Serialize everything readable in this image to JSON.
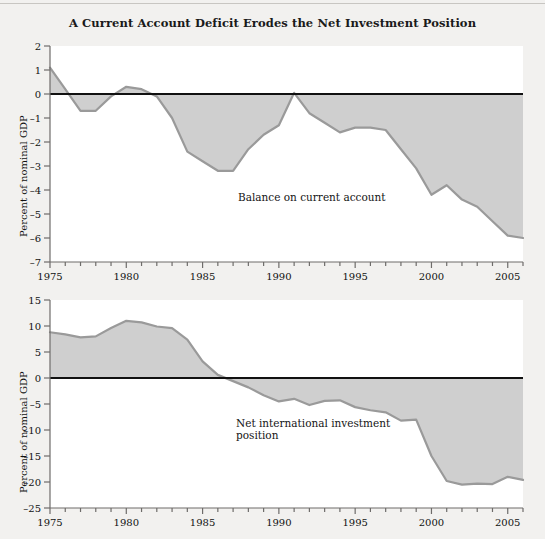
{
  "title": "A Current Account Deficit Erodes the Net Investment Position",
  "colors": {
    "page_background": "#f2f1ef",
    "plot_background": "#ffffff",
    "area_fill": "#cfcfcf",
    "series_line": "#9a9a9a",
    "zero_line": "#111111",
    "axis_line": "#6e6c6a",
    "text": "#111111"
  },
  "panels": [
    {
      "id": "current-account",
      "ylabel": "Percent of nominal GDP",
      "series_label": "Balance on current account",
      "yticks": [
        2,
        1,
        0,
        -1,
        -2,
        -3,
        -4,
        -5,
        -6,
        -7
      ],
      "ytick_labels": [
        "2",
        "1",
        "0",
        "–1",
        "–2",
        "–3",
        "–4",
        "–5",
        "–6",
        "–7"
      ],
      "xticks_major": [
        1975,
        1980,
        1985,
        1990,
        1995,
        2000,
        2005
      ],
      "xtick_labels": [
        "1975",
        "1980",
        "1985",
        "1990",
        "1995",
        "2000",
        "2005"
      ],
      "chart_data": {
        "type": "area",
        "title": "A Current Account Deficit Erodes the Net Investment Position",
        "xlabel": "",
        "ylabel": "Percent of nominal GDP",
        "xlim": [
          1975,
          2006
        ],
        "ylim": [
          -7,
          2
        ],
        "grid": false,
        "legend": "inline-annotation",
        "annotation": "Balance on current account",
        "x": [
          1975,
          1976,
          1977,
          1978,
          1979,
          1980,
          1981,
          1982,
          1983,
          1984,
          1985,
          1986,
          1987,
          1988,
          1989,
          1990,
          1991,
          1992,
          1993,
          1994,
          1995,
          1996,
          1997,
          1998,
          1999,
          2000,
          2001,
          2002,
          2003,
          2004,
          2005,
          2006
        ],
        "values": [
          1.1,
          0.2,
          -0.7,
          -0.7,
          -0.1,
          0.3,
          0.2,
          -0.1,
          -1.0,
          -2.4,
          -2.8,
          -3.2,
          -3.2,
          -2.3,
          -1.7,
          -1.3,
          0.05,
          -0.8,
          -1.2,
          -1.6,
          -1.4,
          -1.4,
          -1.5,
          -2.3,
          -3.1,
          -4.2,
          -3.8,
          -4.4,
          -4.7,
          -5.3,
          -5.9,
          -6.0
        ]
      }
    },
    {
      "id": "net-investment-position",
      "ylabel": "Percent of nominal GDP",
      "series_label": "Net international investment\nposition",
      "yticks": [
        15,
        10,
        5,
        0,
        -5,
        -10,
        -15,
        -20,
        -25
      ],
      "ytick_labels": [
        "15",
        "10",
        "5",
        "0",
        "–5",
        "–10",
        "–15",
        "–20",
        "–25"
      ],
      "xticks_major": [
        1975,
        1980,
        1985,
        1990,
        1995,
        2000,
        2005
      ],
      "xtick_labels": [
        "1975",
        "1980",
        "1985",
        "1990",
        "1995",
        "2000",
        "2005"
      ],
      "chart_data": {
        "type": "area",
        "title": "",
        "xlabel": "",
        "ylabel": "Percent of nominal GDP",
        "xlim": [
          1975,
          2006
        ],
        "ylim": [
          -25,
          15
        ],
        "grid": false,
        "legend": "inline-annotation",
        "annotation": "Net international investment position",
        "x": [
          1975,
          1976,
          1977,
          1978,
          1979,
          1980,
          1981,
          1982,
          1983,
          1984,
          1985,
          1986,
          1987,
          1988,
          1989,
          1990,
          1991,
          1992,
          1993,
          1994,
          1995,
          1996,
          1997,
          1998,
          1999,
          2000,
          2001,
          2002,
          2003,
          2004,
          2005,
          2006
        ],
        "values": [
          8.8,
          8.4,
          7.8,
          8.0,
          9.6,
          11.0,
          10.7,
          9.9,
          9.6,
          7.4,
          3.2,
          0.6,
          -0.6,
          -1.8,
          -3.3,
          -4.5,
          -4.0,
          -5.2,
          -4.4,
          -4.3,
          -5.6,
          -6.2,
          -6.6,
          -8.2,
          -8.0,
          -15.0,
          -19.8,
          -20.5,
          -20.3,
          -20.4,
          -19.0,
          -19.6
        ]
      }
    }
  ]
}
